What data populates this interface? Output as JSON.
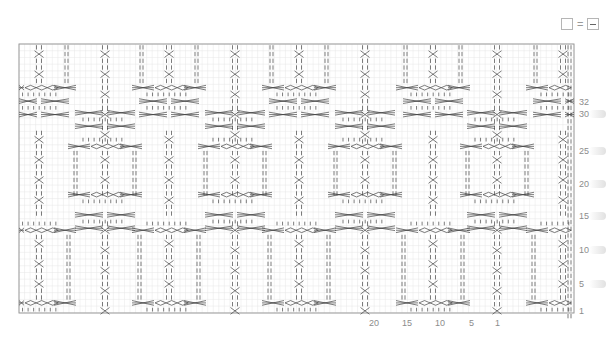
{
  "legend": {
    "symbol_empty": "empty-square",
    "equals": "=",
    "symbol_purl": "purl-dash",
    "meaning": "empty square = purl"
  },
  "chart": {
    "left": 19,
    "top": 44,
    "width": 555,
    "height": 269,
    "cell_w": 5.55,
    "cell_h": 6.72,
    "grid_color": "#e6e6e6",
    "border_color": "#9a9a9a",
    "symbol_color": "#444444",
    "motif_period_px": 130,
    "middle_band": {
      "y_top": 143,
      "y_bottom": 198,
      "cable_columns_x": [
        39,
        169,
        299,
        433,
        563
      ],
      "box_centers_x": [
        105,
        235,
        365,
        497
      ]
    },
    "outer_bands": {
      "cable_columns_x": [
        105,
        235,
        365,
        497
      ],
      "box_centers_x": [
        39,
        169,
        299,
        433,
        563
      ],
      "top_band": {
        "y_top": 44,
        "y_bottom": 140
      },
      "bottom_band": {
        "y_top": 200,
        "y_bottom": 313
      }
    },
    "edge_stitches_x": [
      568,
      571
    ]
  },
  "row_labels": [
    {
      "text": "32",
      "y": 97
    },
    {
      "text": "30",
      "y": 109
    },
    {
      "text": "25",
      "y": 146
    },
    {
      "text": "20",
      "y": 179
    },
    {
      "text": "15",
      "y": 211
    },
    {
      "text": "10",
      "y": 245
    },
    {
      "text": "5",
      "y": 279
    },
    {
      "text": "1",
      "y": 306
    }
  ],
  "col_labels": [
    {
      "text": "20",
      "x": 369
    },
    {
      "text": "15",
      "x": 402
    },
    {
      "text": "10",
      "x": 435
    },
    {
      "text": "5",
      "x": 469
    },
    {
      "text": "1",
      "x": 495
    }
  ]
}
